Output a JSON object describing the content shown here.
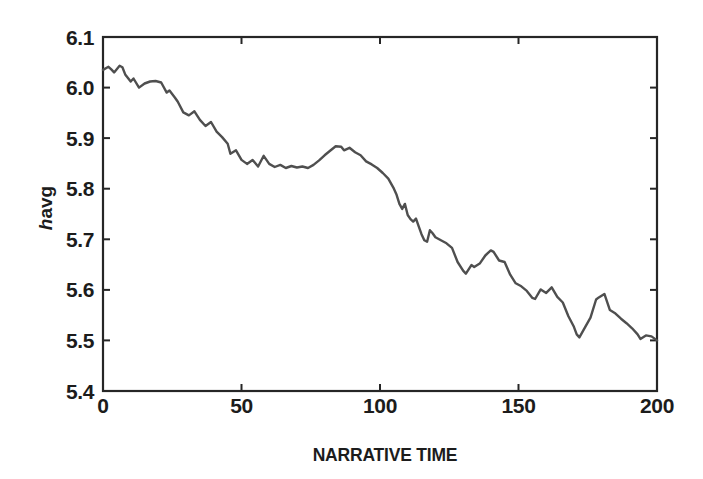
{
  "chart_data": {
    "type": "line",
    "title": "",
    "xlabel": "NARRATIVE TIME",
    "ylabel_italic": "h",
    "ylabel_sub": "avg",
    "xlim": [
      0,
      200
    ],
    "ylim": [
      5.4,
      6.1
    ],
    "xticks": [
      0,
      50,
      100,
      150,
      200
    ],
    "xtick_labels": [
      "0",
      "50",
      "100",
      "150",
      "200"
    ],
    "yticks": [
      5.4,
      5.5,
      5.6,
      5.7,
      5.8,
      5.9,
      6.0,
      6.1
    ],
    "ytick_labels": [
      "5.4",
      "5.5",
      "5.6",
      "5.7",
      "5.8",
      "5.9",
      "6.0",
      "6.1"
    ],
    "grid": false,
    "box": true,
    "legend": "none",
    "colors": {
      "line": "#4f4f4f",
      "axis": "#262626",
      "ink": "#1c1c1c",
      "bg": "#ffffff"
    },
    "series": [
      {
        "name": "h-avg vs narrative time",
        "points": [
          [
            0,
            6.035
          ],
          [
            2,
            6.041
          ],
          [
            3,
            6.036
          ],
          [
            4,
            6.03
          ],
          [
            6,
            6.043
          ],
          [
            7,
            6.04
          ],
          [
            8,
            6.026
          ],
          [
            10,
            6.012
          ],
          [
            11,
            6.018
          ],
          [
            13,
            6.0
          ],
          [
            15,
            6.008
          ],
          [
            17,
            6.012
          ],
          [
            19,
            6.013
          ],
          [
            21,
            6.01
          ],
          [
            23,
            5.99
          ],
          [
            24,
            5.994
          ],
          [
            26,
            5.98
          ],
          [
            27,
            5.972
          ],
          [
            29,
            5.951
          ],
          [
            31,
            5.945
          ],
          [
            33,
            5.953
          ],
          [
            35,
            5.936
          ],
          [
            37,
            5.924
          ],
          [
            39,
            5.932
          ],
          [
            41,
            5.913
          ],
          [
            43,
            5.902
          ],
          [
            45,
            5.889
          ],
          [
            46,
            5.869
          ],
          [
            48,
            5.876
          ],
          [
            50,
            5.857
          ],
          [
            52,
            5.849
          ],
          [
            54,
            5.857
          ],
          [
            56,
            5.844
          ],
          [
            58,
            5.865
          ],
          [
            60,
            5.849
          ],
          [
            62,
            5.843
          ],
          [
            64,
            5.847
          ],
          [
            66,
            5.841
          ],
          [
            68,
            5.845
          ],
          [
            70,
            5.842
          ],
          [
            72,
            5.844
          ],
          [
            74,
            5.841
          ],
          [
            76,
            5.847
          ],
          [
            78,
            5.856
          ],
          [
            80,
            5.866
          ],
          [
            82,
            5.875
          ],
          [
            84,
            5.884
          ],
          [
            86,
            5.883
          ],
          [
            87,
            5.876
          ],
          [
            89,
            5.881
          ],
          [
            91,
            5.872
          ],
          [
            93,
            5.866
          ],
          [
            95,
            5.854
          ],
          [
            97,
            5.848
          ],
          [
            99,
            5.841
          ],
          [
            101,
            5.831
          ],
          [
            103,
            5.82
          ],
          [
            105,
            5.8
          ],
          [
            106,
            5.788
          ],
          [
            107,
            5.77
          ],
          [
            108,
            5.76
          ],
          [
            109,
            5.77
          ],
          [
            110,
            5.748
          ],
          [
            111,
            5.74
          ],
          [
            112,
            5.735
          ],
          [
            113,
            5.741
          ],
          [
            114,
            5.725
          ],
          [
            115,
            5.71
          ],
          [
            116,
            5.698
          ],
          [
            117,
            5.695
          ],
          [
            118,
            5.718
          ],
          [
            119,
            5.712
          ],
          [
            120,
            5.704
          ],
          [
            122,
            5.698
          ],
          [
            124,
            5.692
          ],
          [
            126,
            5.683
          ],
          [
            128,
            5.655
          ],
          [
            130,
            5.638
          ],
          [
            131,
            5.632
          ],
          [
            133,
            5.649
          ],
          [
            134,
            5.645
          ],
          [
            136,
            5.652
          ],
          [
            138,
            5.668
          ],
          [
            140,
            5.678
          ],
          [
            141,
            5.675
          ],
          [
            143,
            5.658
          ],
          [
            145,
            5.655
          ],
          [
            147,
            5.63
          ],
          [
            149,
            5.613
          ],
          [
            151,
            5.607
          ],
          [
            153,
            5.598
          ],
          [
            155,
            5.584
          ],
          [
            156,
            5.582
          ],
          [
            158,
            5.601
          ],
          [
            160,
            5.594
          ],
          [
            162,
            5.605
          ],
          [
            164,
            5.586
          ],
          [
            166,
            5.575
          ],
          [
            168,
            5.548
          ],
          [
            170,
            5.527
          ],
          [
            171,
            5.512
          ],
          [
            172,
            5.506
          ],
          [
            174,
            5.526
          ],
          [
            176,
            5.545
          ],
          [
            178,
            5.581
          ],
          [
            179,
            5.585
          ],
          [
            181,
            5.592
          ],
          [
            183,
            5.56
          ],
          [
            185,
            5.553
          ],
          [
            187,
            5.543
          ],
          [
            189,
            5.534
          ],
          [
            191,
            5.524
          ],
          [
            193,
            5.512
          ],
          [
            194,
            5.503
          ],
          [
            196,
            5.51
          ],
          [
            198,
            5.508
          ],
          [
            200,
            5.5
          ]
        ]
      }
    ]
  }
}
